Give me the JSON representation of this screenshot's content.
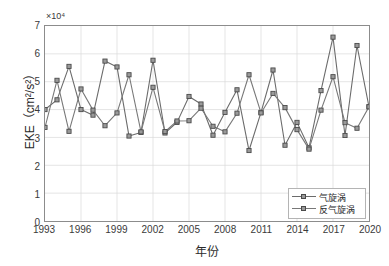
{
  "chart_data": {
    "type": "line",
    "title": "",
    "xlabel": "年份",
    "ylabel": "EKE（cm²/s²）",
    "y_exponent_label": "×10⁴",
    "y_exponent_base": "10",
    "y_exponent_power": "4",
    "grid": true,
    "legend_position": "bottom-right",
    "xlim": [
      1993,
      2020
    ],
    "ylim": [
      0,
      70000
    ],
    "y_tick_values": [
      0,
      10000,
      20000,
      30000,
      40000,
      50000,
      60000,
      70000
    ],
    "y_tick_labels": [
      "0",
      "1",
      "2",
      "3",
      "4",
      "5",
      "6",
      "7"
    ],
    "x_tick_values": [
      1993,
      1996,
      1999,
      2002,
      2005,
      2008,
      2011,
      2014,
      2017,
      2020
    ],
    "x_tick_labels": [
      "1993",
      "1996",
      "1999",
      "2002",
      "2005",
      "2008",
      "2011",
      "2014",
      "2017",
      "2020"
    ],
    "x": [
      1993,
      1994,
      1995,
      1996,
      1997,
      1998,
      1999,
      2000,
      2001,
      2002,
      2003,
      2004,
      2005,
      2006,
      2007,
      2008,
      2009,
      2010,
      2011,
      2012,
      2013,
      2014,
      2015,
      2016,
      2017,
      2018,
      2019,
      2020
    ],
    "series": [
      {
        "name": "气旋涡",
        "color": "#6b6b6b",
        "marker": "square",
        "values": [
          40000,
          43500,
          55500,
          40000,
          38000,
          57400,
          55300,
          30500,
          31800,
          57700,
          31600,
          35400,
          44700,
          42000,
          30800,
          39000,
          47100,
          25300,
          39000,
          54200,
          27200,
          35400,
          26300,
          46800,
          66000,
          30700,
          63000,
          41000
        ]
      },
      {
        "name": "反气旋涡",
        "color": "#787878",
        "marker": "square",
        "values": [
          33600,
          50500,
          32200,
          47400,
          39800,
          34200,
          38800,
          52500,
          32000,
          48000,
          32100,
          35900,
          36000,
          40500,
          34000,
          32000,
          38700,
          52500,
          38800,
          45800,
          40700,
          32800,
          25800,
          39800,
          51800,
          35300,
          33300,
          41000
        ]
      }
    ]
  },
  "legend": {
    "items": [
      {
        "label": "气旋涡"
      },
      {
        "label": "反气旋涡"
      }
    ]
  }
}
